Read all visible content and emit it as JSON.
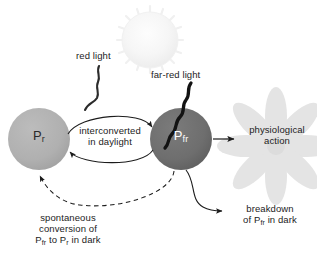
{
  "diagram": {
    "colors": {
      "pr_circle": "#b0b0b0",
      "pfr_circle": "#6e6e6e",
      "flower": "#e2e2e2",
      "sun": "#f4f4f4",
      "stroke": "#1c1c1c",
      "background": "#ffffff"
    }
  },
  "labels": {
    "red_light": "red light",
    "far_red_light": "far-red light",
    "interconverted_line1": "interconverted",
    "interconverted_line2": "in daylight",
    "physiological_line1": "physiological",
    "physiological_line2": "action",
    "breakdown_line1": "breakdown",
    "breakdown_line2_pre": "of P",
    "breakdown_line2_sub": "fr",
    "breakdown_line2_post": " in dark",
    "spontaneous_line1": "spontaneous",
    "spontaneous_line2": "conversion of",
    "spontaneous_line3_a": "P",
    "spontaneous_line3_sub_a": "fr",
    "spontaneous_line3_mid": " to P",
    "spontaneous_line3_sub_b": "r",
    "spontaneous_line3_end": " in dark"
  },
  "nodes": {
    "pr": {
      "symbol": "P",
      "subscript": "r"
    },
    "pfr": {
      "symbol": "P",
      "subscript": "fr"
    }
  },
  "icons": {
    "sun": "sun-icon",
    "flower": "flower-icon",
    "red_light_wave": "red-light-wave-icon",
    "far_red_light_wave": "far-red-light-wave-icon"
  }
}
